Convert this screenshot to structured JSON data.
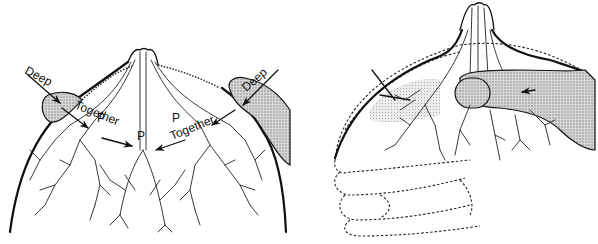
{
  "figure": {
    "left_panel": {
      "labels": {
        "deep_left": "Deep",
        "deep_right": "Deep",
        "together_left": "Together",
        "together_right": "Together",
        "p_left": "P",
        "p_center": "P",
        "p_right": "P"
      }
    },
    "right_panel": {}
  },
  "colors": {
    "ink": "#111111",
    "background": "#ffffff",
    "shading": "#bdbdbd"
  }
}
